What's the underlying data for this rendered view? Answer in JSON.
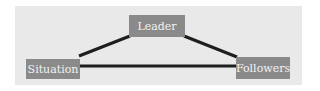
{
  "diagram": {
    "type": "triangle-relationship",
    "nodes": [
      {
        "id": "leader",
        "label": "Leader"
      },
      {
        "id": "situation",
        "label": "Situation"
      },
      {
        "id": "followers",
        "label": "Followers"
      }
    ],
    "edges": [
      {
        "from": "leader",
        "to": "situation"
      },
      {
        "from": "leader",
        "to": "followers"
      },
      {
        "from": "situation",
        "to": "followers"
      }
    ],
    "colors": {
      "panel": "#e9e9e9",
      "node_fill": "#8a8a8a",
      "node_text": "#f2f2f2",
      "edge": "#1e1e1e"
    }
  }
}
